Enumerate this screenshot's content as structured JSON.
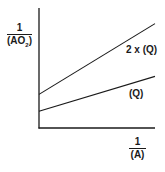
{
  "chart_data": {
    "type": "line",
    "title": "",
    "xlabel": "1/(A)",
    "ylabel": "1/(AO2)",
    "xlabel_parts": {
      "numerator": "1",
      "denominator": "(A)"
    },
    "ylabel_parts": {
      "numerator": "1",
      "denominator_main": "(AO",
      "denominator_sub": "2",
      "denominator_end": ")"
    },
    "grid": false,
    "ticks": "none",
    "legend_position": "inline labels at right end of lines",
    "x": [
      0,
      1
    ],
    "xlim": [
      0,
      1
    ],
    "ylim": [
      0,
      1
    ],
    "series": [
      {
        "name": "2 x (Q)",
        "label": "2 x (Q)",
        "values": [
          0.28,
          0.87
        ]
      },
      {
        "name": "(Q)",
        "label": "(Q)",
        "values": [
          0.14,
          0.43
        ]
      }
    ],
    "annotations": [
      "Lines share slope ratio: upper line intercept and slope are approx. twice those of lower line"
    ]
  },
  "colors": {
    "ink": "#1a1a1a",
    "background": "#ffffff"
  },
  "plot": {
    "origin_px": [
      39,
      128
    ],
    "x_end_px": 155,
    "y_top_px": 8
  }
}
